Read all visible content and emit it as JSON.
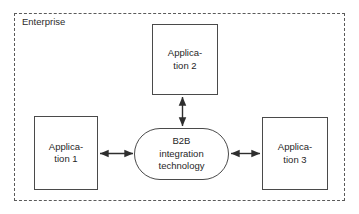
{
  "diagram": {
    "boundary": {
      "label": "Enterprise",
      "style": "dashed",
      "color": "#5a5a5a"
    },
    "nodes": [
      {
        "id": "app1",
        "label": "Applica-\ntion 1",
        "plain_label": "Application 1",
        "shape": "rectangle",
        "color": "#4a4a4a"
      },
      {
        "id": "app2",
        "label": "Applica-\ntion 2",
        "plain_label": "Application 2",
        "shape": "rectangle",
        "color": "#4a4a4a"
      },
      {
        "id": "app3",
        "label": "Applica-\ntion 3",
        "plain_label": "Application 3",
        "shape": "rectangle",
        "color": "#4a4a4a"
      },
      {
        "id": "hub",
        "label": "B2B\nintegration\ntechnology",
        "plain_label": "B2B integration technology",
        "shape": "stadium",
        "color": "#4a4a4a"
      }
    ],
    "connectors": [
      {
        "id": "app1-hub",
        "from": "app1",
        "to": "hub",
        "arrow": "double",
        "orientation": "horizontal"
      },
      {
        "id": "app2-hub",
        "from": "app2",
        "to": "hub",
        "arrow": "double",
        "orientation": "vertical"
      },
      {
        "id": "hub-app3",
        "from": "hub",
        "to": "app3",
        "arrow": "double",
        "orientation": "horizontal"
      }
    ]
  }
}
